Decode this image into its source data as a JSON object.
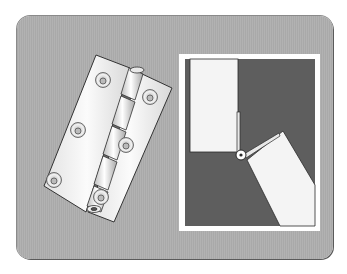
{
  "figure": {
    "panels": [
      {
        "name": "hinge-3d-view",
        "description": "Open butt hinge with two leaves, 6 countersunk screw holes, knuckle barrel"
      },
      {
        "name": "hinge-cross-section",
        "description": "Cross-section of door rotating about hinge pivot"
      }
    ],
    "colors": {
      "panel_bg": "#adadad",
      "inset_frame": "#ffffff",
      "inset_dark": "#5e5e5e",
      "door": "#f4f4f4",
      "outline": "#2a2a2a"
    }
  }
}
